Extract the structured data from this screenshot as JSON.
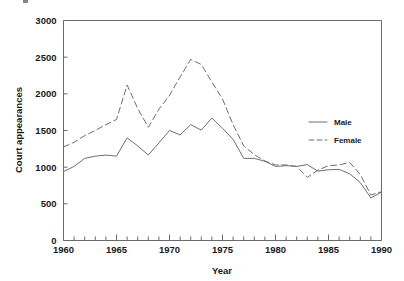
{
  "chart_data": {
    "type": "line",
    "title": "",
    "xlabel": "Year",
    "ylabel": "Court appearances",
    "xlim": [
      1960,
      1990
    ],
    "ylim": [
      0,
      3000
    ],
    "ytick_labels": [
      "0",
      "500",
      "1000",
      "1500",
      "2000",
      "2500",
      "3000"
    ],
    "ytick_values": [
      0,
      500,
      1000,
      1500,
      2000,
      2500,
      3000
    ],
    "xtick_labels": [
      "1960",
      "1965",
      "1970",
      "1975",
      "1980",
      "1985",
      "1990"
    ],
    "xtick_values": [
      1960,
      1965,
      1970,
      1975,
      1980,
      1985,
      1990
    ],
    "minor_xticks_interval": 1,
    "grid": false,
    "legend_position": "center right inside",
    "x": [
      1960,
      1961,
      1962,
      1963,
      1964,
      1965,
      1966,
      1967,
      1968,
      1969,
      1970,
      1971,
      1972,
      1973,
      1974,
      1975,
      1976,
      1977,
      1978,
      1979,
      1980,
      1981,
      1982,
      1983,
      1984,
      1985,
      1986,
      1987,
      1988,
      1989,
      1990
    ],
    "series": [
      {
        "name": "Male",
        "style": "solid",
        "values": [
          940,
          1010,
          1120,
          1150,
          1165,
          1150,
          1400,
          1290,
          1165,
          1330,
          1500,
          1440,
          1580,
          1505,
          1670,
          1530,
          1380,
          1120,
          1120,
          1080,
          1010,
          1020,
          1010,
          1035,
          945,
          965,
          970,
          910,
          790,
          580,
          660
        ]
      },
      {
        "name": "Female",
        "style": "dashed",
        "values": [
          1275,
          1340,
          1430,
          1500,
          1580,
          1650,
          2120,
          1800,
          1545,
          1790,
          1980,
          2230,
          2470,
          2400,
          2160,
          1930,
          1580,
          1290,
          1170,
          1085,
          1030,
          1030,
          1010,
          860,
          960,
          1020,
          1030,
          1065,
          900,
          620,
          665
        ]
      }
    ],
    "legend": [
      {
        "label": "Male",
        "style": "solid"
      },
      {
        "label": "Female",
        "style": "dashed"
      }
    ]
  }
}
